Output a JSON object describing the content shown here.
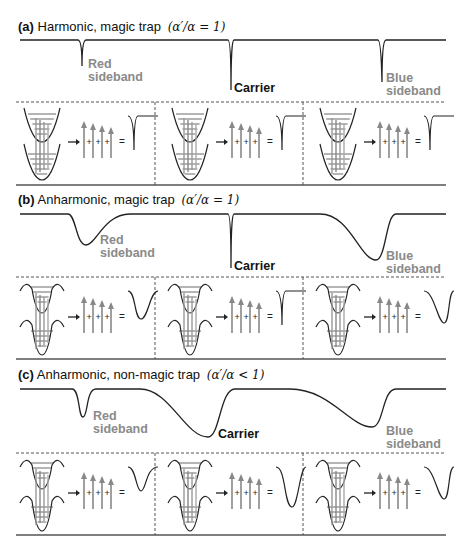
{
  "panels": [
    {
      "id": "a",
      "tag": "(a)",
      "title": "Harmonic, magic trap",
      "condition": "(α′/α = 1)",
      "labels": {
        "red": [
          "Red",
          "sideband"
        ],
        "carrier": "Carrier",
        "blue": [
          "Blue",
          "sideband"
        ]
      },
      "trap": "harmonic",
      "spectrum_shape": "three narrow dips",
      "cells": [
        {
          "transition": "red sideband",
          "result": "narrow dip"
        },
        {
          "transition": "carrier",
          "result": "narrow dip"
        },
        {
          "transition": "blue sideband",
          "result": "narrow dip"
        }
      ]
    },
    {
      "id": "b",
      "tag": "(b)",
      "title": "Anharmonic, magic trap",
      "condition": "(α′/α = 1)",
      "labels": {
        "red": [
          "Red",
          "sideband"
        ],
        "carrier": "Carrier",
        "blue": [
          "Blue",
          "sideband"
        ]
      },
      "trap": "anharmonic",
      "spectrum_shape": "broadened sidebands, narrow carrier",
      "cells": [
        {
          "transition": "red sideband",
          "result": "broad dip"
        },
        {
          "transition": "carrier",
          "result": "narrow dip"
        },
        {
          "transition": "blue sideband",
          "result": "broad dip"
        }
      ]
    },
    {
      "id": "c",
      "tag": "(c)",
      "title": "Anharmonic, non-magic trap",
      "condition": "(α′/α < 1)",
      "labels": {
        "red": [
          "Red",
          "sideband"
        ],
        "carrier": "Carrier",
        "blue": [
          "Blue",
          "sideband"
        ]
      },
      "trap": "anharmonic, differing depths",
      "spectrum_shape": "narrow red sideband, broad carrier and blue sideband",
      "cells": [
        {
          "transition": "red sideband",
          "result": "narrow-ish dip"
        },
        {
          "transition": "carrier",
          "result": "broad dip"
        },
        {
          "transition": "blue sideband",
          "result": "broad dip"
        }
      ]
    }
  ],
  "symbols": {
    "plus": "+",
    "equals": "="
  },
  "colors": {
    "line": "#222222",
    "arrow": "#888888",
    "sideband_label": "#8a8a8a",
    "carrier_label": "#111111",
    "divider": "#555555"
  }
}
